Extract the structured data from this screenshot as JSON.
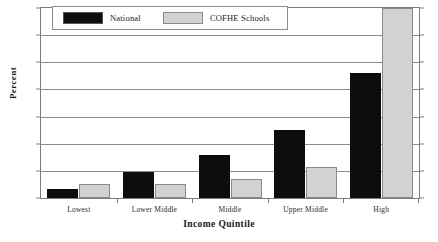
{
  "chart_data": {
    "type": "bar",
    "title": "",
    "xlabel": "Income Quintile",
    "ylabel": "Percent",
    "categories": [
      "Lowest",
      "Lower Middle",
      "Middle",
      "Upper Middle",
      "High"
    ],
    "series": [
      {
        "name": "National",
        "color": "#0d0d0d",
        "values": [
          3.5,
          9.5,
          16,
          25,
          46
        ]
      },
      {
        "name": "COFHE Schools",
        "color": "#d2d2d2",
        "values": [
          5,
          5,
          7,
          11.5,
          70
        ]
      }
    ],
    "ylim": [
      0,
      70
    ],
    "yticks": [
      0,
      10,
      20,
      30,
      40,
      50,
      60,
      70
    ],
    "ytick_labels": [
      "",
      "10",
      "20",
      "30",
      "40",
      "50",
      "60",
      "70"
    ],
    "grid": true,
    "grid_axis": "y",
    "legend_position": "top-left"
  },
  "legend": {
    "items": [
      {
        "label": "National"
      },
      {
        "label": "COFHE Schools"
      }
    ]
  }
}
